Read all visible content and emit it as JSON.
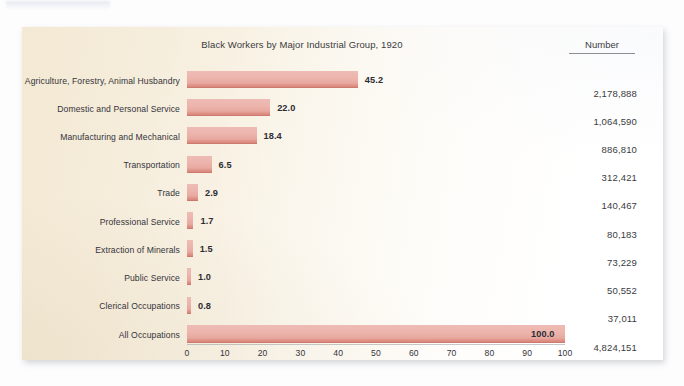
{
  "panel": {
    "title": "Black Workers by Major Industrial Group, 1920",
    "number_column_header": "Number",
    "bar_color": "#eab3ab",
    "bar_edge_color": "#d9857a",
    "panel_background": "#f5ecd9"
  },
  "chart_data": {
    "type": "bar",
    "orientation": "horizontal",
    "title": "Black Workers by Major Industrial Group, 1920",
    "xlabel": "Percentage",
    "ylabel": "",
    "xlim": [
      0,
      100
    ],
    "xticks": [
      0,
      10,
      20,
      30,
      40,
      50,
      60,
      70,
      80,
      90,
      100
    ],
    "grid": false,
    "legend": null,
    "categories": [
      "Agriculture, Forestry, Animal Husbandry",
      "Domestic and Personal Service",
      "Manufacturing and Mechanical",
      "Transportation",
      "Trade",
      "Professional Service",
      "Extraction of Minerals",
      "Public Service",
      "Clerical Occupations",
      "All Occupations"
    ],
    "values": [
      45.2,
      22.0,
      18.4,
      6.5,
      2.9,
      1.7,
      1.5,
      1.0,
      0.8,
      100.0
    ],
    "value_labels": [
      "45.2",
      "22.0",
      "18.4",
      "6.5",
      "2.9",
      "1.7",
      "1.5",
      "1.0",
      "0.8",
      "100.0"
    ],
    "numbers": [
      "2,178,888",
      "1,064,590",
      "886,810",
      "312,421",
      "140,467",
      "80,183",
      "73,229",
      "50,552",
      "37,011",
      "4,824,151"
    ],
    "numbers_raw": [
      2178888,
      1064590,
      886810,
      312421,
      140467,
      80183,
      73229,
      50552,
      37011,
      4824151
    ],
    "secondary_column_header": "Number"
  }
}
